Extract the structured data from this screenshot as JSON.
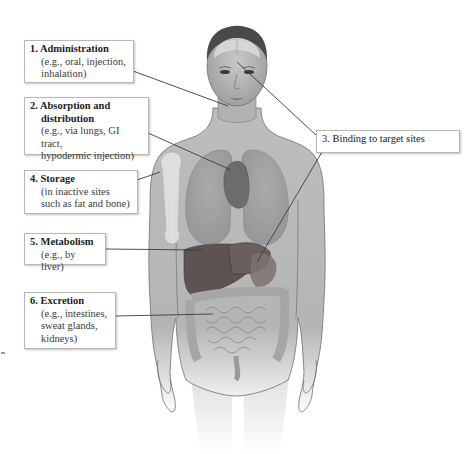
{
  "figure": {
    "colors": {
      "skin": "#b9b9b9",
      "skin_outline": "#6e6e6e",
      "organs_liver": "#6e5a5a",
      "leader_line": "#3c3c3c",
      "box_border": "#b8b8b8",
      "text": "#2a2a2a"
    }
  },
  "labels": [
    {
      "id": "administration",
      "number": "1.",
      "title_line1": "Administration",
      "title_line2": "",
      "description": "(e.g., oral, injection,\ninhalation)"
    },
    {
      "id": "absorption-distribution",
      "number": "2.",
      "title_line1": "Absorption and",
      "title_line2": "distribution",
      "description": "(e.g., via lungs, GI tract,\nhypodermic injection)"
    },
    {
      "id": "binding",
      "number": "3.",
      "title_line1": "Binding to target sites",
      "title_line2": "",
      "description": ""
    },
    {
      "id": "storage",
      "number": "4.",
      "title_line1": "Storage",
      "title_line2": "",
      "description": "(in inactive sites\nsuch as fat and bone)"
    },
    {
      "id": "metabolism",
      "number": "5.",
      "title_line1": "Metabolism",
      "title_line2": "",
      "description": "(e.g., by liver)"
    },
    {
      "id": "excretion",
      "number": "6.",
      "title_line1": "Excretion",
      "title_line2": "",
      "description": "(e.g., intestines,\nsweat glands,\nkidneys)"
    }
  ]
}
